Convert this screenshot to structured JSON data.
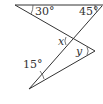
{
  "diagram": {
    "type": "geometry-angles",
    "labels": {
      "angle_top_left": "30°",
      "angle_top_right": "45°",
      "angle_bottom": "15°",
      "var_x": "x",
      "var_y": "y"
    },
    "colors": {
      "line": "#333333",
      "text": "#333333",
      "background": "#ffffff"
    }
  }
}
